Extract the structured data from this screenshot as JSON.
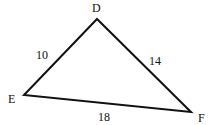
{
  "diagram": {
    "type": "triangle",
    "vertices": [
      {
        "label": "D",
        "x": 97,
        "y": 19
      },
      {
        "label": "E",
        "x": 24,
        "y": 95
      },
      {
        "label": "F",
        "x": 191,
        "y": 112
      }
    ],
    "sides": [
      {
        "from": "E",
        "to": "D",
        "length": "10"
      },
      {
        "from": "D",
        "to": "F",
        "length": "14"
      },
      {
        "from": "E",
        "to": "F",
        "length": "18"
      }
    ],
    "stroke_color": "#111111"
  }
}
